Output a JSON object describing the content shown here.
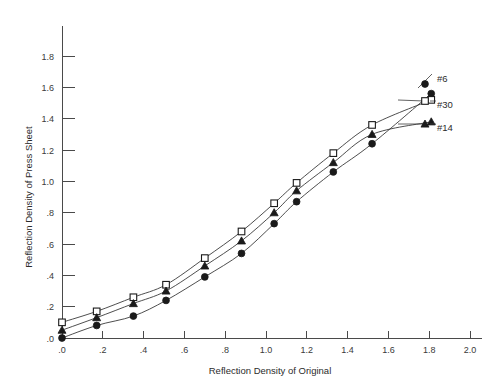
{
  "chart_data": {
    "type": "scatter",
    "title": "",
    "xlabel": "Reflection Density of Original",
    "ylabel": "Reflection Density of Press Sheet",
    "xlim": [
      0.0,
      2.0
    ],
    "ylim": [
      0.0,
      1.9
    ],
    "grid": false,
    "legend_position": "right",
    "xticks": [
      ".0",
      ".2",
      ".4",
      ".6",
      ".8",
      "1.0",
      "1.2",
      "1.4",
      "1.6",
      "1.8",
      "2.0"
    ],
    "xtick_values": [
      0.0,
      0.2,
      0.4,
      0.6,
      0.8,
      1.0,
      1.2,
      1.4,
      1.6,
      1.8,
      2.0
    ],
    "yticks": [
      ".0",
      ".2",
      ".4",
      ".6",
      ".8",
      "1.0",
      "1.2",
      "1.4",
      "1.6",
      "1.8"
    ],
    "ytick_values": [
      0.0,
      0.2,
      0.4,
      0.6,
      0.8,
      1.0,
      1.2,
      1.4,
      1.6,
      1.8
    ],
    "series": [
      {
        "name": "#6",
        "marker": "filled-circle",
        "x": [
          0.0,
          0.17,
          0.35,
          0.51,
          0.7,
          0.88,
          1.04,
          1.15,
          1.33,
          1.52,
          1.81
        ],
        "y": [
          0.0,
          0.08,
          0.14,
          0.24,
          0.39,
          0.54,
          0.73,
          0.87,
          1.06,
          1.24,
          1.56
        ]
      },
      {
        "name": "#30",
        "marker": "open-square",
        "x": [
          0.0,
          0.17,
          0.35,
          0.51,
          0.7,
          0.88,
          1.04,
          1.15,
          1.33,
          1.52,
          1.81
        ],
        "y": [
          0.1,
          0.17,
          0.26,
          0.34,
          0.51,
          0.68,
          0.86,
          0.99,
          1.18,
          1.36,
          1.52
        ]
      },
      {
        "name": "#14",
        "marker": "filled-triangle",
        "x": [
          0.0,
          0.17,
          0.35,
          0.51,
          0.7,
          0.88,
          1.04,
          1.15,
          1.33,
          1.52,
          1.81
        ],
        "y": [
          0.05,
          0.13,
          0.22,
          0.3,
          0.46,
          0.62,
          0.8,
          0.94,
          1.12,
          1.3,
          1.38
        ]
      }
    ],
    "legend": [
      {
        "label": "#6",
        "marker": "filled-circle"
      },
      {
        "label": "#30",
        "marker": "open-square"
      },
      {
        "label": "#14",
        "marker": "filled-triangle"
      }
    ]
  },
  "colors": {
    "background": "#ffffff",
    "axis": "#4a4a4a",
    "line": "#3a3a3a",
    "marker": "#1a1a1a",
    "text": "#2b2b2b"
  }
}
